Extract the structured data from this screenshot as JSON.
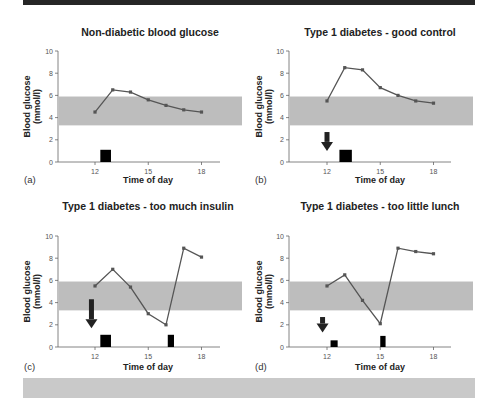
{
  "page": {
    "top_bar_color": "#262626",
    "bottom_bar_color": "#c9c9c9",
    "band_color": "#bdbdbd",
    "line_color": "#555555"
  },
  "chart_data": [
    {
      "type": "line",
      "panel": "(a)",
      "title": "Non-diabetic blood glucose",
      "xlabel": "Time of day",
      "ylabel": "Blood glucose (mmol/l)",
      "x": [
        12,
        13,
        14,
        15,
        16,
        17,
        18
      ],
      "values": [
        4.5,
        6.5,
        6.3,
        5.6,
        5.1,
        4.7,
        4.5
      ],
      "xticks": [
        "12",
        "15",
        "18"
      ],
      "yticks": [
        "0",
        "2",
        "4",
        "6",
        "8",
        "10"
      ],
      "ylim": [
        0,
        10
      ],
      "normal_range_band": [
        3.3,
        5.9
      ],
      "meal_bars": [
        {
          "start": 12.3,
          "end": 12.9,
          "height": 1.1
        }
      ],
      "insulin_arrows": []
    },
    {
      "type": "line",
      "panel": "(b)",
      "title": "Type 1 diabetes - good control",
      "xlabel": "Time of day",
      "ylabel": "Blood glucose (mmol/l)",
      "x": [
        12,
        13,
        14,
        15,
        16,
        17,
        18
      ],
      "values": [
        5.5,
        8.5,
        8.3,
        6.7,
        6.0,
        5.5,
        5.3
      ],
      "xticks": [
        "12",
        "15",
        "18"
      ],
      "yticks": [
        "0",
        "2",
        "4",
        "6",
        "8",
        "10"
      ],
      "ylim": [
        0,
        10
      ],
      "normal_range_band": [
        3.3,
        5.9
      ],
      "meal_bars": [
        {
          "start": 12.7,
          "end": 13.4,
          "height": 1.1
        }
      ],
      "insulin_arrows": [
        {
          "x": 12.0,
          "from": 2.7,
          "to": 1.0
        }
      ]
    },
    {
      "type": "line",
      "panel": "(c)",
      "title": "Type 1 diabetes - too much insulin",
      "xlabel": "Time of day",
      "ylabel": "Blood glucose (mmol/l)",
      "x": [
        12,
        13,
        14,
        15,
        16,
        17,
        18
      ],
      "values": [
        5.5,
        7.0,
        5.4,
        3.0,
        2.0,
        8.9,
        8.1
      ],
      "xticks": [
        "12",
        "15",
        "18"
      ],
      "yticks": [
        "0",
        "2",
        "4",
        "6",
        "8",
        "10"
      ],
      "ylim": [
        0,
        10
      ],
      "normal_range_band": [
        3.3,
        5.9
      ],
      "meal_bars": [
        {
          "start": 12.3,
          "end": 12.9,
          "height": 1.1
        },
        {
          "start": 16.1,
          "end": 16.45,
          "height": 1.1
        }
      ],
      "insulin_arrows": [
        {
          "x": 11.8,
          "from": 4.3,
          "to": 1.7
        }
      ]
    },
    {
      "type": "line",
      "panel": "(d)",
      "title": "Type 1 diabetes - too little lunch",
      "xlabel": "Time of day",
      "ylabel": "Blood glucose (mmol/l)",
      "x": [
        12,
        13,
        14,
        15,
        16,
        17,
        18
      ],
      "values": [
        5.5,
        6.5,
        4.2,
        2.1,
        8.9,
        8.6,
        8.4
      ],
      "xticks": [
        "12",
        "15",
        "18"
      ],
      "yticks": [
        "0",
        "2",
        "4",
        "6",
        "8",
        "10"
      ],
      "ylim": [
        0,
        10
      ],
      "normal_range_band": [
        3.3,
        5.9
      ],
      "meal_bars": [
        {
          "start": 12.2,
          "end": 12.6,
          "height": 0.6
        },
        {
          "start": 15.0,
          "end": 15.3,
          "height": 1.0
        }
      ],
      "insulin_arrows": [
        {
          "x": 11.75,
          "from": 2.7,
          "to": 1.3
        }
      ]
    }
  ]
}
